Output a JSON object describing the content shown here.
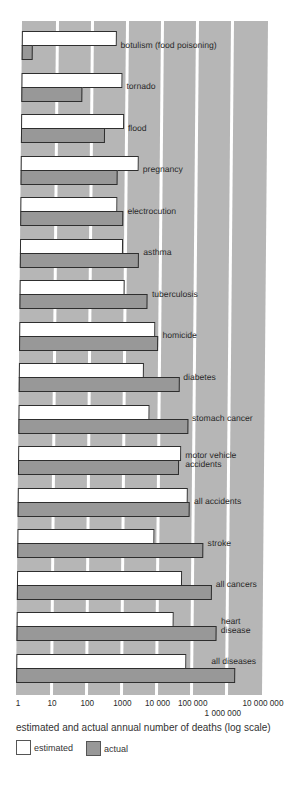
{
  "chart_data": {
    "type": "bar",
    "orientation": "horizontal",
    "title": "",
    "xlabel": "estimated and actual annual number of deaths (log scale)",
    "ylabel": "",
    "xscale": "log",
    "xlim": [
      1,
      10000000
    ],
    "xticks": [
      1,
      10,
      100,
      1000,
      10000,
      100000,
      1000000,
      10000000
    ],
    "xtick_labels": [
      "1",
      "10",
      "100",
      "1000",
      "10 000",
      "100 000",
      "1 000 000",
      "10 000 000"
    ],
    "xtick_rows": [
      0,
      0,
      0,
      0,
      0,
      0,
      1,
      0
    ],
    "grid": true,
    "legend_position": "bottom-left",
    "categories": [
      "botulism (food poisoning)",
      "tornado",
      "flood",
      "pregnancy",
      "electrocution",
      "asthma",
      "tuberculosis",
      "homicide",
      "diabetes",
      "stomach cancer",
      "motor vehicle accidents",
      "all accidents",
      "stroke",
      "all cancers",
      "heart disease",
      "all diseases"
    ],
    "category_label_lines": [
      [
        "botulism (food poisoning)"
      ],
      [
        "tornado"
      ],
      [
        "flood"
      ],
      [
        "pregnancy"
      ],
      [
        "electrocution"
      ],
      [
        "asthma"
      ],
      [
        "tuberculosis"
      ],
      [
        "homicide"
      ],
      [
        "diabetes"
      ],
      [
        "stomach cancer"
      ],
      [
        "motor vehicle",
        "accidents"
      ],
      [
        "all accidents"
      ],
      [
        "stroke"
      ],
      [
        "all cancers"
      ],
      [
        "heart",
        "disease"
      ],
      [
        "all diseases"
      ]
    ],
    "series": [
      {
        "name": "estimated",
        "color": "#ffffff",
        "values": [
          500,
          750,
          850,
          2300,
          580,
          850,
          1000,
          7500,
          3500,
          5200,
          44000,
          70000,
          8000,
          50000,
          30000,
          70000
        ]
      },
      {
        "name": "actual",
        "color": "#989898",
        "values": [
          2,
          55,
          250,
          560,
          860,
          2500,
          4500,
          9200,
          37000,
          67000,
          38000,
          80000,
          200000,
          350000,
          500000,
          1700000
        ]
      }
    ]
  },
  "colors": {
    "grid_stripe": "#b6b6b6",
    "bar_border": "#2e2e2e"
  }
}
